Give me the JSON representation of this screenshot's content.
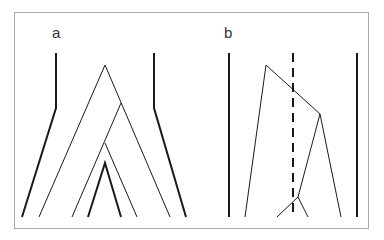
{
  "figure": {
    "border_color": "#a9a9a9",
    "line_color": "#1a1a1a",
    "panels": [
      {
        "label": "a",
        "label_pos": [
          52,
          40
        ],
        "thick_lines": [
          [
            [
              56,
              53
            ],
            [
              56,
              108
            ],
            [
              22,
              217
            ]
          ],
          [
            [
              154,
              53
            ],
            [
              154,
              108
            ],
            [
              186,
              217
            ]
          ],
          [
            [
              88,
              217
            ],
            [
              105,
              163
            ],
            [
              121,
              217
            ]
          ]
        ],
        "thin_lines": [
          [
            [
              39,
              217
            ],
            [
              105,
              65
            ],
            [
              170,
              217
            ]
          ],
          [
            [
              72,
              217
            ],
            [
              121,
              103
            ]
          ],
          [
            [
              105,
              143
            ],
            [
              137,
              217
            ]
          ]
        ],
        "dashed_lines": []
      },
      {
        "label": "b",
        "label_pos": [
          224,
          40
        ],
        "thick_lines": [
          [
            [
              229,
              53
            ],
            [
              229,
              217
            ]
          ],
          [
            [
              357,
              53
            ],
            [
              357,
              217
            ]
          ]
        ],
        "thin_lines": [
          [
            [
              245,
              217
            ],
            [
              266,
              65
            ],
            [
              320,
              114
            ],
            [
              341,
              217
            ]
          ],
          [
            [
              320,
              114
            ],
            [
              298,
              197
            ]
          ],
          [
            [
              277,
              217
            ],
            [
              298,
              197
            ],
            [
              308,
              217
            ]
          ]
        ],
        "dashed_lines": [
          [
            [
              293,
              53
            ],
            [
              293,
              217
            ]
          ]
        ]
      }
    ]
  }
}
